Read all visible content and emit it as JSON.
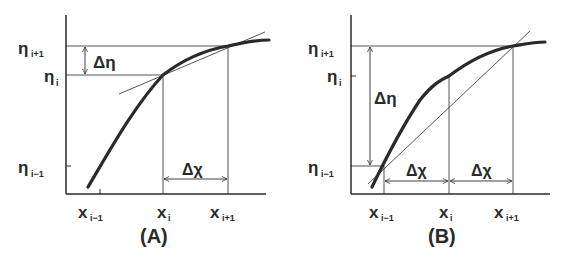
{
  "panels": [
    {
      "id": "A",
      "caption": "(A)",
      "y_labels": {
        "top": "η",
        "top_sub": "i+1",
        "mid": "η",
        "mid_sub": "i",
        "bot": "η",
        "bot_sub": "i−1"
      },
      "x_labels": {
        "left": "x",
        "left_sub": "i−1",
        "mid": "x",
        "mid_sub": "i",
        "right": "x",
        "right_sub": "i+1"
      },
      "delta_y": "Δη",
      "delta_x": "Δχ",
      "description": "Tangent line at x_i approximates slope; forward difference Δη/Δχ"
    },
    {
      "id": "B",
      "caption": "(B)",
      "y_labels": {
        "top": "η",
        "top_sub": "i+1",
        "mid": "η",
        "mid_sub": "i",
        "bot": "η",
        "bot_sub": "i−1"
      },
      "x_labels": {
        "left": "x",
        "left_sub": "i−1",
        "mid": "x",
        "mid_sub": "i",
        "right": "x",
        "right_sub": "i+1"
      },
      "delta_y": "Δη",
      "delta_x_left": "Δχ",
      "delta_x_right": "Δχ",
      "description": "Secant line from x_{i-1} to x_{i+1}; central difference"
    }
  ],
  "colors": {
    "ink": "#2a2a2a",
    "background": "#ffffff"
  }
}
